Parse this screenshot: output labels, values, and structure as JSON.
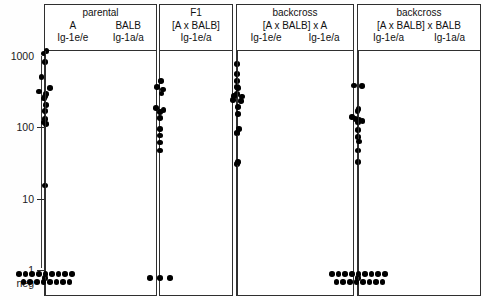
{
  "figure": {
    "plot_type": "strip-dot-plot",
    "y_axis": {
      "scale": "log",
      "unit_note": "",
      "ticks": [
        {
          "label": "1000",
          "value": 1000
        },
        {
          "label": "100",
          "value": 100
        },
        {
          "label": "10",
          "value": 10
        },
        {
          "label": "1",
          "value": 1
        },
        {
          "label": "neg",
          "value": "neg"
        }
      ]
    },
    "groups": [
      {
        "id": "parental",
        "title": "parental",
        "cross": "",
        "columns": [
          {
            "genotype": "Ig-1e/e",
            "strain": "A"
          },
          {
            "genotype": "Ig-1a/a",
            "strain": "BALB"
          }
        ]
      },
      {
        "id": "f1",
        "title": "F1",
        "cross": "[A x BALB]",
        "columns": [
          {
            "genotype": "Ig-1e/a",
            "strain": ""
          }
        ]
      },
      {
        "id": "backcross-a",
        "title": "backcross",
        "cross": "[A x BALB] x A",
        "columns": [
          {
            "genotype": "Ig-1e/e",
            "strain": ""
          },
          {
            "genotype": "Ig-1e/a",
            "strain": ""
          }
        ]
      },
      {
        "id": "backcross-balb",
        "title": "backcross",
        "cross": "[A x BALB] x BALB",
        "columns": [
          {
            "genotype": "Ig-1e/a",
            "strain": ""
          },
          {
            "genotype": "Ig-1a/a",
            "strain": ""
          }
        ]
      }
    ]
  },
  "chart_data": {
    "type": "scatter",
    "title": "",
    "xlabel": "",
    "ylabel": "",
    "yscale": "log",
    "ylim": [
      1,
      1000
    ],
    "ytick_labels": [
      "1000",
      "100",
      "10",
      "1",
      "neg"
    ],
    "ytick_values": [
      1000,
      100,
      10,
      1,
      "neg"
    ],
    "grid": false,
    "legend": "none",
    "negative_category": "neg",
    "series": [
      {
        "name": "parental A Ig-1e/e",
        "group": "parental",
        "genotype": "Ig-1e/e",
        "n_positive": 15,
        "n_negative": 1,
        "values": [
          1000,
          920,
          700,
          430,
          300,
          270,
          250,
          230,
          215,
          175,
          145,
          112,
          100,
          95,
          13
        ],
        "jitter": [
          0.5,
          -0.6,
          0,
          -1.4,
          2.0,
          -2.4,
          0.3,
          0,
          -0.3,
          0.3,
          0,
          0,
          -0.4,
          0.4,
          0
        ],
        "negatives": 1
      },
      {
        "name": "parental BALB Ig-1a/a",
        "group": "parental",
        "genotype": "Ig-1a/a",
        "n_positive": 0,
        "n_negative": 17,
        "values": [],
        "jitter": [],
        "negatives": 17
      },
      {
        "name": "F1 [A x BALB] Ig-1e/a",
        "group": "f1",
        "genotype": "Ig-1e/a",
        "n_positive": 12,
        "n_negative": 3,
        "values": [
          380,
          310,
          290,
          255,
          160,
          150,
          140,
          115,
          80,
          65,
          52,
          40
        ],
        "jitter": [
          0.4,
          -1.2,
          1.2,
          0.6,
          -1.6,
          1.4,
          0.0,
          0.0,
          0.0,
          0.0,
          0.0,
          0.0
        ],
        "negatives": 3
      },
      {
        "name": "backcross [A x BALB] x A  Ig-1e/e",
        "group": "backcross-a",
        "genotype": "Ig-1e/e",
        "n_positive": 8,
        "n_negative": 0,
        "values": [
          660,
          480,
          380,
          310,
          250,
          205,
          200,
          70,
          26
        ],
        "jitter": [
          0,
          0,
          0,
          0,
          0,
          -1.6,
          1.6,
          0,
          0
        ],
        "negatives": 0
      },
      {
        "name": "backcross [A x BALB] x A  Ig-1e/a",
        "group": "backcross-a",
        "genotype": "Ig-1e/a",
        "n_positive": 8,
        "n_negative": 0,
        "values": [
          300,
          235,
          230,
          165,
          130,
          80,
          72,
          28
        ],
        "jitter": [
          0,
          -1.5,
          1.5,
          0,
          0,
          0.3,
          -0.3,
          0
        ],
        "negatives": 0
      },
      {
        "name": "backcross [A x BALB] x BALB  Ig-1e/a",
        "group": "backcross-balb",
        "genotype": "Ig-1e/a",
        "n_positive": 13,
        "n_negative": 1,
        "values": [
          330,
          325,
          155,
          145,
          118,
          112,
          108,
          104,
          100,
          78,
          62,
          40,
          28
        ],
        "jitter": [
          -1.6,
          1.6,
          0.2,
          -0.2,
          -2.4,
          -1.0,
          0.4,
          1.8,
          0,
          0,
          0,
          0,
          0
        ],
        "negatives": 1
      },
      {
        "name": "backcross [A x BALB] x BALB  Ig-1a/a",
        "group": "backcross-balb",
        "genotype": "Ig-1a/a",
        "n_positive": 1,
        "n_negative": 17,
        "values": [
          54
        ],
        "jitter": [
          0
        ],
        "negatives": 17
      }
    ]
  },
  "layout": {
    "axis_px": {
      "y_1000": 56,
      "y_100": 127.3,
      "y_10": 198.6,
      "y_1": 268,
      "neg_row": 283
    },
    "groups_px": [
      {
        "id": "parental",
        "left": 44,
        "width": 113
      },
      {
        "id": "f1",
        "left": 159,
        "width": 74
      },
      {
        "id": "backcross-a",
        "left": 236,
        "width": 118
      },
      {
        "id": "backcross-balb",
        "left": 357,
        "width": 124
      }
    ]
  }
}
